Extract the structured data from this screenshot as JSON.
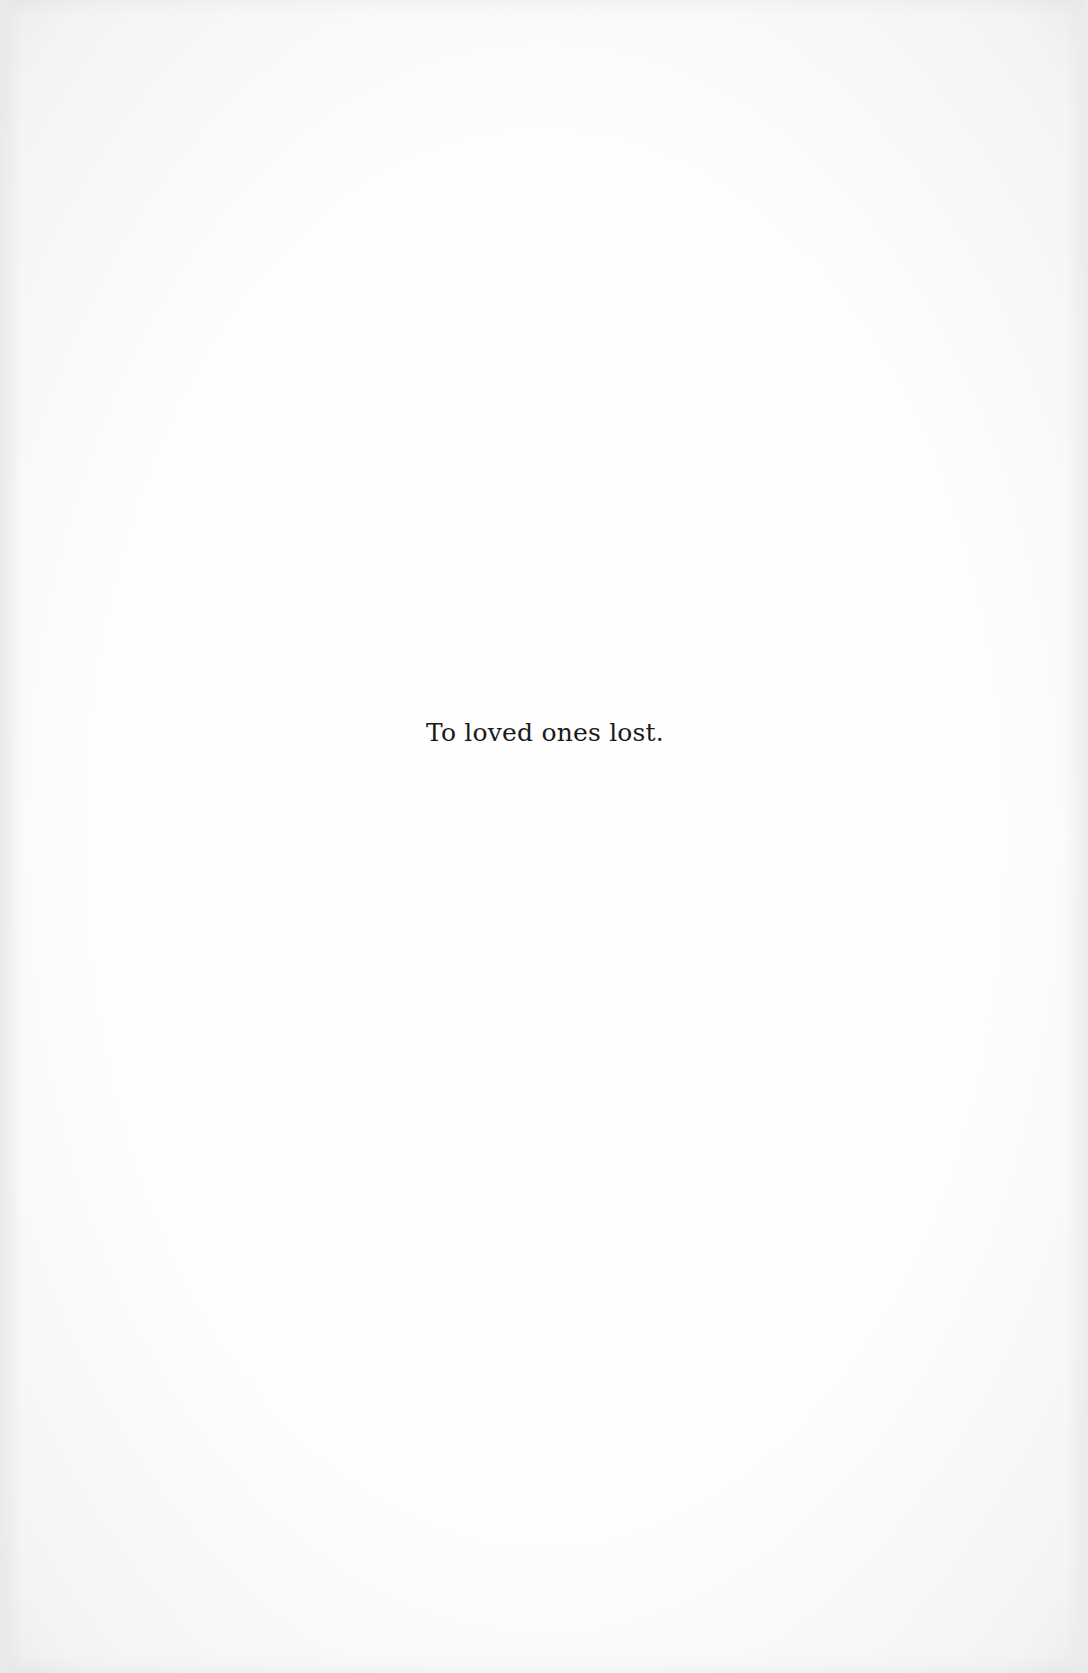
{
  "page": {
    "background_color": "#fdfdfd",
    "text_color": "#1a1a1a"
  },
  "dedication": {
    "text": "To loved ones lost."
  }
}
